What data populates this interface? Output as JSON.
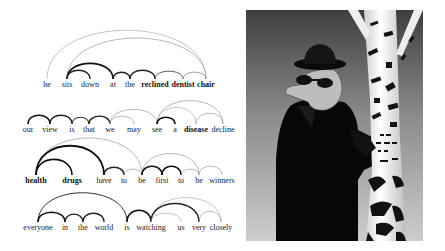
{
  "figure": {
    "left_panel": {
      "description": "dependency-style attention arcs over sentences",
      "sentences": [
        {
          "baseline_y": 88,
          "words": [
            {
              "text": "he",
              "x": 47,
              "bold": false
            },
            {
              "text": "sits",
              "x": 67,
              "bold": false
            },
            {
              "text": "down",
              "x": 90,
              "bold": false
            },
            {
              "text": "at",
              "x": 113,
              "bold": false
            },
            {
              "text": "the",
              "x": 130,
              "bold": false
            },
            {
              "text": "reclined",
              "x": 155,
              "bold": true
            },
            {
              "text": "dentist",
              "x": 183,
              "bold": true
            },
            {
              "text": "chair",
              "x": 206,
              "bold": true
            }
          ],
          "arcs": [
            {
              "from": 0,
              "to": 7,
              "h": 50,
              "w": 0.7,
              "c": "#aaaaaa"
            },
            {
              "from": 1,
              "to": 7,
              "h": 42,
              "w": 0.7,
              "c": "#999999"
            },
            {
              "from": 1,
              "to": 3,
              "h": 16,
              "w": 1.6,
              "c": "#111111"
            },
            {
              "from": 1,
              "to": 2,
              "h": 9,
              "w": 1.4,
              "c": "#222222"
            },
            {
              "from": 3,
              "to": 4,
              "h": 7,
              "w": 1.4,
              "c": "#222222"
            },
            {
              "from": 4,
              "to": 5,
              "h": 9,
              "w": 1.4,
              "c": "#222222"
            },
            {
              "from": 5,
              "to": 6,
              "h": 8,
              "w": 1.0,
              "c": "#555555"
            },
            {
              "from": 6,
              "to": 7,
              "h": 7,
              "w": 0.8,
              "c": "#888888"
            }
          ]
        },
        {
          "baseline_y": 133,
          "words": [
            {
              "text": "our",
              "x": 28,
              "bold": false
            },
            {
              "text": "view",
              "x": 50,
              "bold": false
            },
            {
              "text": "is",
              "x": 72,
              "bold": false
            },
            {
              "text": "that",
              "x": 89,
              "bold": false
            },
            {
              "text": "we",
              "x": 110,
              "bold": false
            },
            {
              "text": "may",
              "x": 134,
              "bold": false
            },
            {
              "text": "see",
              "x": 157,
              "bold": false
            },
            {
              "text": "a",
              "x": 175,
              "bold": false
            },
            {
              "text": "disease",
              "x": 196,
              "bold": true
            },
            {
              "text": "decline",
              "x": 223,
              "bold": false
            }
          ],
          "arcs": [
            {
              "from": 0,
              "to": 1,
              "h": 9,
              "w": 1.6,
              "c": "#111111"
            },
            {
              "from": 1,
              "to": 2,
              "h": 9,
              "w": 1.4,
              "c": "#222222"
            },
            {
              "from": 2,
              "to": 3,
              "h": 7,
              "w": 1.1,
              "c": "#333333"
            },
            {
              "from": 3,
              "to": 4,
              "h": 8,
              "w": 1.3,
              "c": "#222222"
            },
            {
              "from": 4,
              "to": 6,
              "h": 15,
              "w": 0.7,
              "c": "#999999"
            },
            {
              "from": 4,
              "to": 5,
              "h": 8,
              "w": 0.7,
              "c": "#999999"
            },
            {
              "from": 6,
              "to": 9,
              "h": 24,
              "w": 0.7,
              "c": "#999999"
            },
            {
              "from": 6,
              "to": 8,
              "h": 17,
              "w": 0.7,
              "c": "#aaaaaa"
            },
            {
              "from": 6,
              "to": 7,
              "h": 7,
              "w": 1.6,
              "c": "#111111"
            },
            {
              "from": 8,
              "to": 9,
              "h": 11,
              "w": 0.7,
              "c": "#999999"
            }
          ]
        },
        {
          "baseline_y": 184,
          "words": [
            {
              "text": "health",
              "x": 36,
              "bold": true
            },
            {
              "text": "drugs",
              "x": 72,
              "bold": true
            },
            {
              "text": "have",
              "x": 104,
              "bold": false
            },
            {
              "text": "to",
              "x": 124,
              "bold": false
            },
            {
              "text": "be",
              "x": 142,
              "bold": false
            },
            {
              "text": "first",
              "x": 162,
              "bold": false
            },
            {
              "text": "to",
              "x": 181,
              "bold": false
            },
            {
              "text": "be",
              "x": 199,
              "bold": false
            },
            {
              "text": "winners",
              "x": 222,
              "bold": false
            }
          ],
          "arcs": [
            {
              "from": 0,
              "to": 4,
              "h": 38,
              "w": 0.7,
              "c": "#999999"
            },
            {
              "from": 0,
              "to": 2,
              "h": 30,
              "w": 1.8,
              "c": "#111111"
            },
            {
              "from": 0,
              "to": 1,
              "h": 16,
              "w": 1.6,
              "c": "#111111"
            },
            {
              "from": 2,
              "to": 3,
              "h": 8,
              "w": 1.4,
              "c": "#222222"
            },
            {
              "from": 3,
              "to": 4,
              "h": 6,
              "w": 0.7,
              "c": "#999999"
            },
            {
              "from": 4,
              "to": 7,
              "h": 22,
              "w": 0.7,
              "c": "#999999"
            },
            {
              "from": 4,
              "to": 5,
              "h": 9,
              "w": 1.6,
              "c": "#111111"
            },
            {
              "from": 5,
              "to": 6,
              "h": 9,
              "w": 1.6,
              "c": "#111111"
            },
            {
              "from": 6,
              "to": 7,
              "h": 6,
              "w": 0.7,
              "c": "#999999"
            },
            {
              "from": 7,
              "to": 8,
              "h": 9,
              "w": 0.7,
              "c": "#999999"
            }
          ]
        },
        {
          "baseline_y": 231,
          "words": [
            {
              "text": "everyone",
              "x": 38,
              "bold": false
            },
            {
              "text": "in",
              "x": 65,
              "bold": false
            },
            {
              "text": "the",
              "x": 83,
              "bold": false
            },
            {
              "text": "world",
              "x": 104,
              "bold": false
            },
            {
              "text": "is",
              "x": 127,
              "bold": false
            },
            {
              "text": "watching",
              "x": 151,
              "bold": false
            },
            {
              "text": "us",
              "x": 181,
              "bold": false
            },
            {
              "text": "very",
              "x": 199,
              "bold": false
            },
            {
              "text": "closely",
              "x": 221,
              "bold": false
            }
          ],
          "arcs": [
            {
              "from": 0,
              "to": 4,
              "h": 30,
              "w": 1.0,
              "c": "#333333"
            },
            {
              "from": 0,
              "to": 1,
              "h": 10,
              "w": 1.6,
              "c": "#111111"
            },
            {
              "from": 1,
              "to": 2,
              "h": 8,
              "w": 1.3,
              "c": "#222222"
            },
            {
              "from": 2,
              "to": 3,
              "h": 9,
              "w": 1.4,
              "c": "#222222"
            },
            {
              "from": 4,
              "to": 5,
              "h": 12,
              "w": 1.6,
              "c": "#111111"
            },
            {
              "from": 5,
              "to": 8,
              "h": 25,
              "w": 0.7,
              "c": "#aaaaaa"
            },
            {
              "from": 5,
              "to": 7,
              "h": 19,
              "w": 1.4,
              "c": "#222222"
            },
            {
              "from": 5,
              "to": 6,
              "h": 9,
              "w": 0.7,
              "c": "#aaaaaa"
            },
            {
              "from": 7,
              "to": 8,
              "h": 11,
              "w": 0.7,
              "c": "#999999"
            }
          ]
        }
      ]
    },
    "right_panel": {
      "description": "cartoon of a man in black hat, sunglasses and coat hiding behind a birch tree",
      "colors": {
        "sky_top": "#4a4a4a",
        "sky_bottom": "#c8c8c8",
        "coat": "#0a0a0a",
        "skin": "#b8b8b8",
        "bark": "#f2f2f2",
        "bark_mark": "#111111"
      }
    }
  }
}
